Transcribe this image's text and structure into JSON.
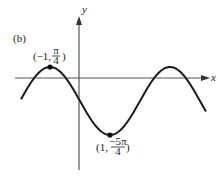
{
  "figure": {
    "panel_label": "(b)",
    "axes": {
      "x_label": "x",
      "y_label": "y"
    },
    "curve": {
      "description": "sinusoidal curve",
      "stroke_color": "#1a1a1a"
    },
    "points": [
      {
        "name": "maximum",
        "coord_prefix": "(−1, ",
        "numerator": "π",
        "denominator": "4",
        "coord_suffix": ")"
      },
      {
        "name": "minimum",
        "coord_prefix": "(1, ",
        "numerator": "−5π",
        "denominator": "4",
        "coord_suffix": ")"
      }
    ]
  },
  "colors": {
    "axis": "#555555",
    "curve": "#1a1a1a",
    "text": "#222222",
    "background": "#ffffff"
  }
}
